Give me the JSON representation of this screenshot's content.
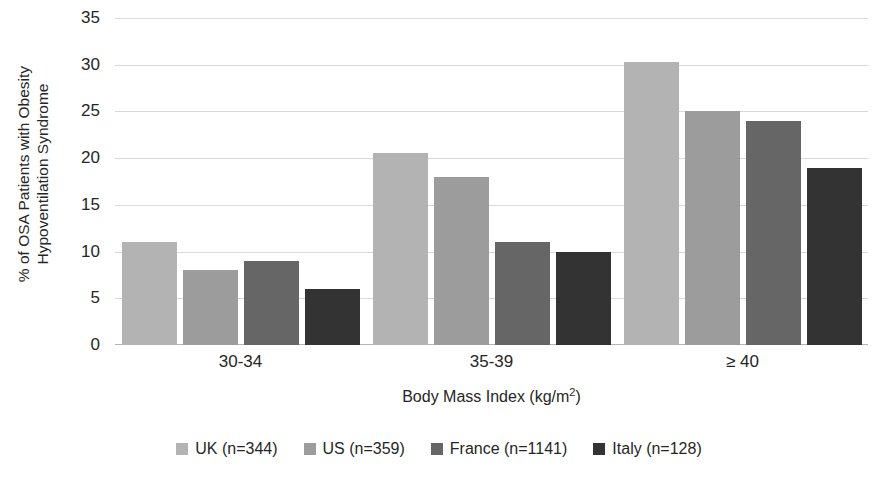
{
  "chart_data": {
    "type": "bar",
    "title": "",
    "categories": [
      "30-34",
      "35-39",
      "≥ 40"
    ],
    "series": [
      {
        "name": "UK (n=344)",
        "values": [
          11.0,
          20.5,
          30.3
        ],
        "color": "#b3b3b3"
      },
      {
        "name": "US (n=359)",
        "values": [
          8.0,
          18.0,
          25.0
        ],
        "color": "#9c9c9c"
      },
      {
        "name": "France (n=1141)",
        "values": [
          9.0,
          11.0,
          24.0
        ],
        "color": "#666666"
      },
      {
        "name": "Italy (n=128)",
        "values": [
          6.0,
          10.0,
          18.9
        ],
        "color": "#333333"
      }
    ],
    "xlabel": "Body Mass Index (kg/m2)",
    "xlabel_base": "Body Mass Index (kg/m",
    "xlabel_sup": "2",
    "xlabel_tail": ")",
    "ylabel": "% of OSA Patients with Obesity\nHypoventilation Syndrome",
    "ylim": [
      0,
      35
    ],
    "yticks": [
      0,
      5,
      10,
      15,
      20,
      25,
      30,
      35
    ],
    "ytick_labels": [
      "0",
      "5",
      "10",
      "15",
      "20",
      "25",
      "30",
      "35"
    ],
    "grid": true,
    "legend_position": "bottom"
  }
}
